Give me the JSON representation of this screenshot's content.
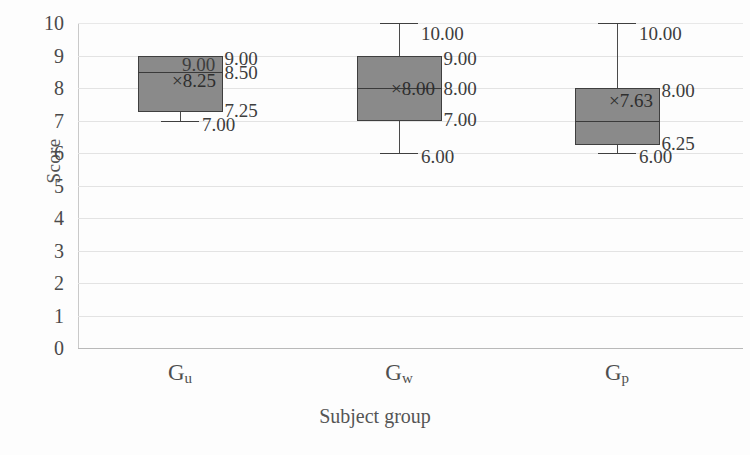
{
  "chart_data": {
    "type": "box",
    "title": "",
    "xlabel": "Subject group",
    "ylabel": "Score",
    "ylim": [
      0,
      10
    ],
    "ytick_labels": [
      "10",
      "9",
      "8",
      "7",
      "6",
      "5",
      "4",
      "3",
      "2",
      "1",
      "0"
    ],
    "yticks": [
      10,
      9,
      8,
      7,
      6,
      5,
      4,
      3,
      2,
      1,
      0
    ],
    "grid": true,
    "legend": "none",
    "categories": [
      "Gu",
      "Gw",
      "Gp"
    ],
    "category_labels": [
      {
        "base": "G",
        "sub": "u"
      },
      {
        "base": "G",
        "sub": "w"
      },
      {
        "base": "G",
        "sub": "p"
      }
    ],
    "series": [
      {
        "name": "Gu",
        "min": 7.0,
        "q1": 7.25,
        "median": 8.5,
        "mean": 8.25,
        "q3": 9.0,
        "max": 9.0,
        "labels": {
          "max": "9.00",
          "q3": "9.00",
          "median": "8.50",
          "mean": "×8.25",
          "q1": "7.25",
          "min": "7.00"
        }
      },
      {
        "name": "Gw",
        "min": 6.0,
        "q1": 7.0,
        "median": 8.0,
        "mean": 8.0,
        "q3": 9.0,
        "max": 10.0,
        "labels": {
          "max": "10.00",
          "q3": "9.00",
          "median": "8.00",
          "mean": "×8.00",
          "q1": "7.00",
          "min": "6.00"
        }
      },
      {
        "name": "Gp",
        "min": 6.0,
        "q1": 6.25,
        "median": 7.0,
        "mean": 7.63,
        "q3": 8.0,
        "max": 10.0,
        "labels": {
          "max": "10.00",
          "q3": "8.00",
          "median": "",
          "mean": "×7.63",
          "q1": "6.25",
          "min": "6.00"
        }
      }
    ],
    "colors": {
      "box_fill": "#8a8a8a",
      "box_border": "#3f3f3f",
      "gridline": "#e3e3e3",
      "axis": "#c9c9c9",
      "text": "#4a4a4a"
    }
  }
}
